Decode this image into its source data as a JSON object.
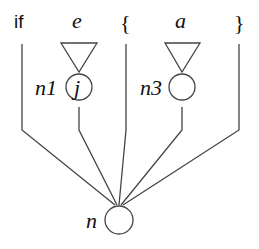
{
  "diagram": {
    "tokens": {
      "if": "if",
      "e": "e",
      "open_brace": "{",
      "a": "a",
      "close_brace": "}"
    },
    "nodes": {
      "n1": {
        "label": "n1",
        "content": "j"
      },
      "n3": {
        "label": "n3",
        "content": ""
      },
      "n": {
        "label": "n",
        "content": ""
      }
    }
  }
}
